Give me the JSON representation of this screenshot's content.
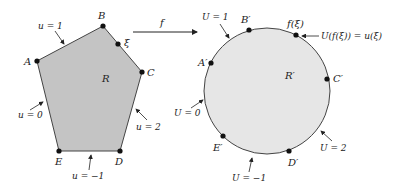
{
  "diagram": {
    "colors": {
      "region_fill": "#c4c4c4",
      "disk_fill": "#e6e6e6",
      "stroke": "#444444",
      "point": "#111111"
    },
    "map_label": "f",
    "left": {
      "region_label": "R",
      "vertices": [
        {
          "name": "A",
          "x": 37,
          "y": 61
        },
        {
          "name": "B",
          "x": 103,
          "y": 26
        },
        {
          "name": "C",
          "x": 142,
          "y": 72
        },
        {
          "name": "D",
          "x": 120,
          "y": 151
        },
        {
          "name": "E",
          "x": 59,
          "y": 151
        }
      ],
      "xi_point": {
        "label": "ξ",
        "x": 118,
        "y": 44
      },
      "boundary_values": {
        "AB": "u = 1",
        "BC_C": "u = 2",
        "DE": "u = −1",
        "EA": "u = 0"
      }
    },
    "right": {
      "region_label": "R′",
      "circle": {
        "cx": 267,
        "cy": 91,
        "r": 63
      },
      "points": [
        {
          "name": "A′",
          "x": 211,
          "y": 63
        },
        {
          "name": "B′",
          "x": 249,
          "y": 30
        },
        {
          "name": "C′",
          "x": 327,
          "y": 79
        },
        {
          "name": "D′",
          "x": 289,
          "y": 151
        },
        {
          "name": "E′",
          "x": 223,
          "y": 136
        }
      ],
      "f_xi_point": {
        "label": "f(ξ)",
        "x": 296,
        "y": 35
      },
      "boundary_values": {
        "A_B": "U = 1",
        "C_D": "U = 2",
        "D_E": "U = −1",
        "E_A": "U = 0"
      },
      "equation": "U(f(ξ)) = u(ξ)"
    }
  }
}
